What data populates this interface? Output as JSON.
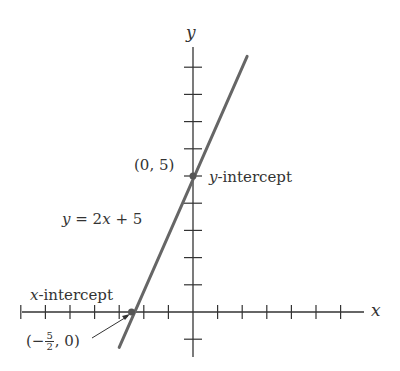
{
  "chart_data": {
    "type": "line",
    "title": "",
    "xlabel": "x",
    "ylabel": "y",
    "equation": "y = 2x + 5",
    "slope": 2,
    "intercept": 5,
    "line_endpoints": [
      [
        -3,
        -1.3
      ],
      [
        2.2,
        9.4
      ]
    ],
    "x_ticks": [
      -7,
      -6,
      -5,
      -4,
      -3,
      -2,
      -1,
      1,
      2,
      3,
      4,
      5,
      6
    ],
    "y_ticks": [
      -1,
      1,
      2,
      3,
      4,
      5,
      6,
      7,
      8,
      9
    ],
    "xlim": [
      -7,
      7
    ],
    "ylim": [
      -1.7,
      10
    ],
    "grid": false,
    "tick_labels_shown": false,
    "points": [
      {
        "name": "y-intercept",
        "x": 0,
        "y": 5,
        "label": "(0, 5)"
      },
      {
        "name": "x-intercept",
        "x": -2.5,
        "y": 0,
        "label": "(-5/2, 0)"
      }
    ],
    "annotations": [
      "y-intercept",
      "x-intercept",
      "y = 2x + 5"
    ]
  },
  "labels": {
    "x_axis": "x",
    "y_axis": "y",
    "equation_y": "y",
    "equation_eq": " = 2",
    "equation_x": "x",
    "equation_rest": " + 5",
    "y_intercept_point": "(0, 5)",
    "y_intercept_var": "y",
    "y_intercept_text": "-intercept",
    "x_intercept_var": "x",
    "x_intercept_text": "-intercept",
    "x_intercept_open": "(−",
    "x_intercept_num": "5",
    "x_intercept_den": "2",
    "x_intercept_close": ", 0)"
  },
  "colors": {
    "axis": "#333333",
    "line": "#666666",
    "point": "#555555"
  }
}
